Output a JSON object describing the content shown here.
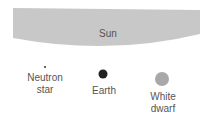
{
  "diagram": {
    "sun": {
      "label": "Sun",
      "color": "#c8c8c8"
    },
    "objects": [
      {
        "label_line1": "Neutron",
        "label_line2": "star",
        "color": "#333333"
      },
      {
        "label_line1": "Earth",
        "label_line2": "",
        "color": "#222222"
      },
      {
        "label_line1": "White",
        "label_line2": "dwarf",
        "color": "#a8a8a8"
      }
    ]
  }
}
